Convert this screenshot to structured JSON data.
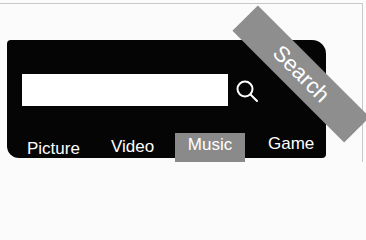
{
  "search": {
    "input_value": "",
    "placeholder": "",
    "button_label": "Search",
    "icon": "magnifier-icon"
  },
  "tabs": [
    {
      "label": "Picture",
      "active": false
    },
    {
      "label": "Video",
      "active": false
    },
    {
      "label": "Music",
      "active": true
    },
    {
      "label": "Game",
      "active": false
    }
  ],
  "colors": {
    "panel": "#050505",
    "active_tab": "#8a8a8a",
    "banner": "#8e8e8e",
    "text": "#ffffff"
  }
}
